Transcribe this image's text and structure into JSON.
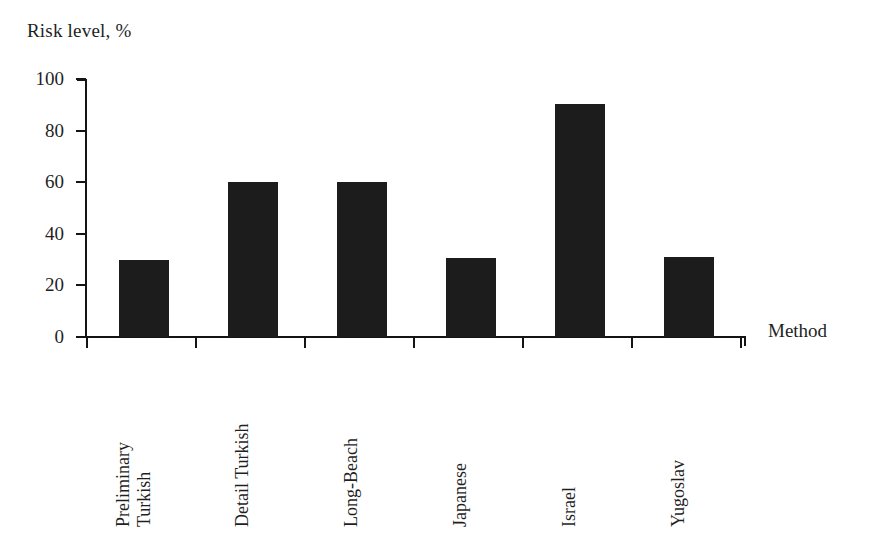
{
  "chart_data": {
    "type": "bar",
    "title": "",
    "subtitle": "",
    "categories": [
      "Preliminary Turkish",
      "Detail Turkish",
      "Long-Beach",
      "Japanese",
      "Israel",
      "Yugoslav"
    ],
    "values": [
      30,
      60,
      60,
      30.5,
      90.5,
      31
    ],
    "ylabel": "Risk level, %",
    "xlabel": "Method",
    "ylim": [
      0,
      100
    ],
    "yticks": [
      0,
      20,
      40,
      60,
      80,
      100
    ],
    "ytick_labels": [
      "0",
      "20",
      "40",
      "60",
      "80",
      "100"
    ],
    "grid": false,
    "legend": false,
    "bar_color": "#1c1c1c",
    "axis_color": "#141414",
    "background": "#ffffff"
  },
  "axes": {
    "y_title": "Risk level, %",
    "x_title": "Method"
  },
  "category_labels": [
    {
      "line1": "Preliminary",
      "line2": "Turkish"
    },
    {
      "line1": "Detail Turkish",
      "line2": ""
    },
    {
      "line1": "Long-Beach",
      "line2": ""
    },
    {
      "line1": "Japanese",
      "line2": ""
    },
    {
      "line1": "Israel",
      "line2": ""
    },
    {
      "line1": "Yugoslav",
      "line2": ""
    }
  ],
  "ticks": {
    "y": [
      {
        "label": "100",
        "value": 100
      },
      {
        "label": "80",
        "value": 80
      },
      {
        "label": "60",
        "value": 60
      },
      {
        "label": "40",
        "value": 40
      },
      {
        "label": "20",
        "value": 20
      },
      {
        "label": "0",
        "value": 0
      }
    ]
  }
}
